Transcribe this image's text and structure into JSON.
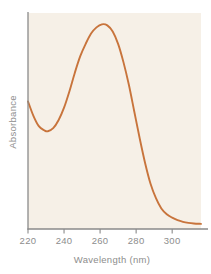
{
  "chart_data": {
    "type": "line",
    "title": "",
    "xlabel": "Wavelength (nm)",
    "ylabel": "Absorbance",
    "xlim": [
      220,
      316
    ],
    "ylim": [
      0,
      1.05
    ],
    "xticks": [
      220,
      240,
      260,
      280,
      300
    ],
    "xtick_labels": [
      "220",
      "240",
      "260",
      "280",
      "300"
    ],
    "yticks": [],
    "ytick_labels": [],
    "grid": false,
    "legend": null,
    "annotations": [],
    "series": [
      {
        "name": "Absorbance spectrum",
        "color": "#c8743c",
        "x": [
          220,
          223,
          226,
          229,
          231,
          234,
          237,
          240,
          243,
          246,
          249,
          252,
          255,
          258,
          261,
          264,
          267,
          270,
          273,
          276,
          279,
          282,
          285,
          288,
          291,
          294,
          297,
          300,
          303,
          306,
          309,
          312,
          316
        ],
        "y": [
          0.62,
          0.55,
          0.5,
          0.48,
          0.475,
          0.49,
          0.53,
          0.59,
          0.67,
          0.76,
          0.84,
          0.9,
          0.95,
          0.98,
          0.995,
          0.99,
          0.96,
          0.9,
          0.81,
          0.7,
          0.57,
          0.44,
          0.32,
          0.22,
          0.15,
          0.1,
          0.072,
          0.055,
          0.043,
          0.035,
          0.03,
          0.027,
          0.025
        ]
      }
    ],
    "peak": {
      "x": 261,
      "y": 0.995,
      "label": "260"
    },
    "trough": {
      "x": 231,
      "y": 0.475,
      "label": "230"
    }
  },
  "axes": {
    "x_axis_label": "Wavelength (nm)",
    "y_axis_label": "Absorbance"
  },
  "colors": {
    "curve": "#c8743c",
    "axis": "#8a8a8a",
    "plot_background": "#f6f0e7",
    "page_background": "#ffffff",
    "text": "#8d8d8d"
  }
}
